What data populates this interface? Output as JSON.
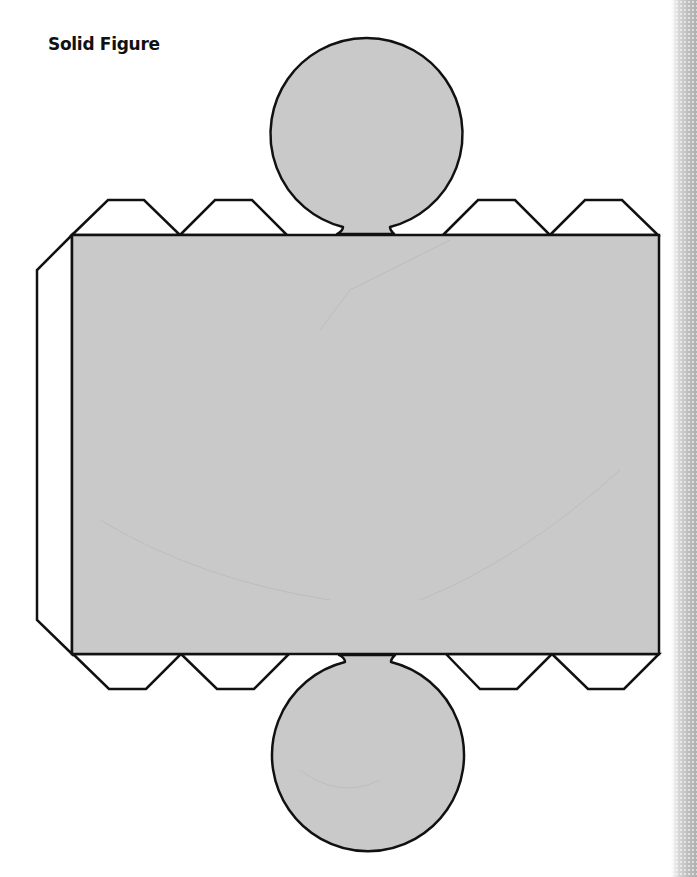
{
  "page": {
    "title": "Solid Figure"
  },
  "figure": {
    "type": "cylinder-net",
    "fill_color": "#c9c9c9",
    "stroke_color": "#111111",
    "tab_fill_color": "#ffffff",
    "body_rectangle": {
      "x": 72,
      "y": 235,
      "width": 587,
      "height": 419
    },
    "top_circle": {
      "cx": 366,
      "cy": 145,
      "r": 96
    },
    "bottom_circle": {
      "cx": 367,
      "cy": 744,
      "r": 96
    },
    "tabs": {
      "top_count": 4,
      "bottom_count": 4,
      "side_count": 1
    }
  },
  "decoration": {
    "right_edge": "halftone-gradient-strip"
  }
}
